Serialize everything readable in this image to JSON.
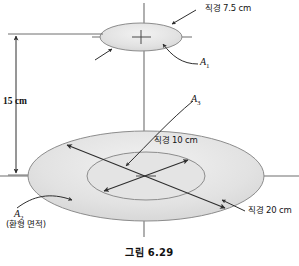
{
  "figure": {
    "caption": "그림 6.29",
    "background_color": "#ffffff",
    "line_color": "#3c3c3c",
    "disk_fill": "#dedede",
    "disk_stroke": "#8c8c8c"
  },
  "labels": {
    "top_diameter": "직경 7.5 cm",
    "inner_diameter": "직경 10 cm",
    "outer_diameter": "직경 20 cm",
    "height_dimension": "15 cm",
    "area_top": "A",
    "area_top_sub": "1",
    "area_annulus": "A",
    "area_annulus_sub": "2",
    "area_annulus_note": "(환형 면적)",
    "area_inner": "A",
    "area_inner_sub": "3"
  },
  "geometry": {
    "top_disk": {
      "cx": 141,
      "cy": 37,
      "rx": 41,
      "ry": 14
    },
    "outer_disk": {
      "cx": 146,
      "cy": 176,
      "rx": 118,
      "ry": 45
    },
    "inner_disk": {
      "cx": 146,
      "cy": 176,
      "rx": 59,
      "ry": 24
    },
    "axis": {
      "x": 144,
      "y_top": 3,
      "y_bottom": 237
    },
    "dimension_line": {
      "x": 16,
      "y_top": 34,
      "y_bottom": 175
    }
  },
  "values": {
    "top_diameter_cm": 7.5,
    "inner_diameter_cm": 10,
    "outer_diameter_cm": 20,
    "separation_cm": 15
  }
}
